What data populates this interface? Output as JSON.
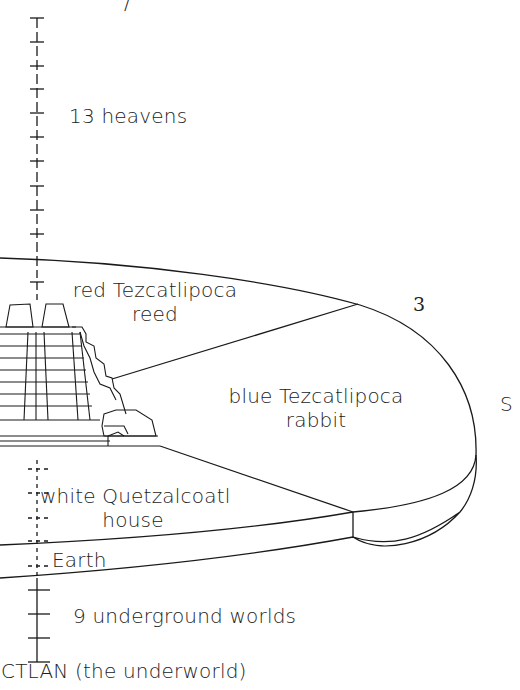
{
  "diagram": {
    "top_glyph": "/",
    "labels": {
      "heavens": "13 heavens",
      "east_line1": "red Tezcatlipoca",
      "east_line2": "reed",
      "south_line1": "blue Tezcatlipoca",
      "south_line2": "rabbit",
      "west_line1": "white Quetzalcoatl",
      "west_line2": "house",
      "earth": "Earth",
      "underground": "9 underground worlds",
      "underworld": "CTLAN (the underworld)",
      "marker_3": "3",
      "marker_s": "S"
    },
    "colors": {
      "line": "#1a1a1a",
      "background": "#ffffff"
    }
  }
}
